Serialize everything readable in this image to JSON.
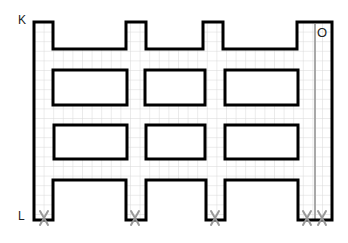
{
  "labels": {
    "K": "K",
    "L": "L",
    "O": "O"
  },
  "marks": {
    "x_symbol": "X",
    "count": 5
  },
  "colors": {
    "outline": "#000000",
    "grid": "#d8d8d8",
    "path_line": "#a8a8a8",
    "x_mark": "#999999"
  }
}
